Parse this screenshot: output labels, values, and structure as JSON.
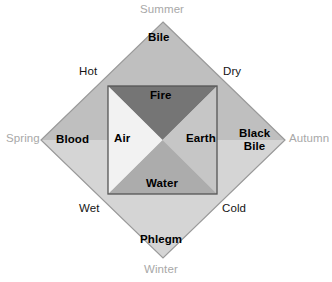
{
  "figure": {
    "shape": "diamond-with-inscribed-square"
  },
  "seasons": [
    {
      "name": "season-summer",
      "label": "Summer",
      "position": "top"
    },
    {
      "name": "season-autumn",
      "label": "Autumn",
      "position": "right"
    },
    {
      "name": "season-winter",
      "label": "Winter",
      "position": "bottom"
    },
    {
      "name": "season-spring",
      "label": "Spring",
      "position": "left"
    }
  ],
  "qualities": [
    {
      "name": "quality-hot",
      "label": "Hot",
      "position": "top-left"
    },
    {
      "name": "quality-dry",
      "label": "Dry",
      "position": "top-right"
    },
    {
      "name": "quality-cold",
      "label": "Cold",
      "position": "bottom-right"
    },
    {
      "name": "quality-wet",
      "label": "Wet",
      "position": "bottom-left"
    }
  ],
  "humours": [
    {
      "name": "humour-bile",
      "label": "Bile",
      "position": "top",
      "fill": "#bfbfbf"
    },
    {
      "name": "humour-black-bile",
      "label": "Black\nBile",
      "line1": "Black",
      "line2": "Bile",
      "position": "right",
      "fill": "#d8d8d8"
    },
    {
      "name": "humour-phlegm",
      "label": "Phlegm",
      "position": "bottom",
      "fill": "#d0d0d0"
    },
    {
      "name": "humour-blood",
      "label": "Blood",
      "position": "left",
      "fill": "#dcdcdc"
    }
  ],
  "elements": [
    {
      "name": "element-fire",
      "label": "Fire",
      "position": "top",
      "fill": "#757575"
    },
    {
      "name": "element-earth",
      "label": "Earth",
      "position": "right",
      "fill": "#c6c6c6"
    },
    {
      "name": "element-water",
      "label": "Water",
      "position": "bottom",
      "fill": "#acacac"
    },
    {
      "name": "element-air",
      "label": "Air",
      "position": "left",
      "fill": "#f2f2f2"
    }
  ],
  "colors": {
    "background": "#ffffff",
    "diamond_outline": "#9a9a9a",
    "square_outline": "#555555",
    "season_text": "#a8a8a8",
    "quality_text": "#141414",
    "humour_text": "#000000",
    "element_text": "#000000",
    "diamond_top": "#bfbfbf",
    "diamond_right": "#d8d8d8",
    "diamond_bottom": "#d0d0d0",
    "diamond_left": "#dcdcdc",
    "square_top": "#757575",
    "square_right": "#c6c6c6",
    "square_bottom": "#acacac",
    "square_left": "#f2f2f2"
  },
  "geometry": {
    "diamond": {
      "top_x": 163,
      "top_y": 22,
      "right_x": 285,
      "right_y": 140,
      "bottom_x": 163,
      "bottom_y": 258,
      "left_x": 41,
      "left_y": 140
    },
    "square": {
      "left": 108,
      "top": 86,
      "right": 217,
      "bottom": 194,
      "center_x": 162.5,
      "center_y": 140
    }
  }
}
